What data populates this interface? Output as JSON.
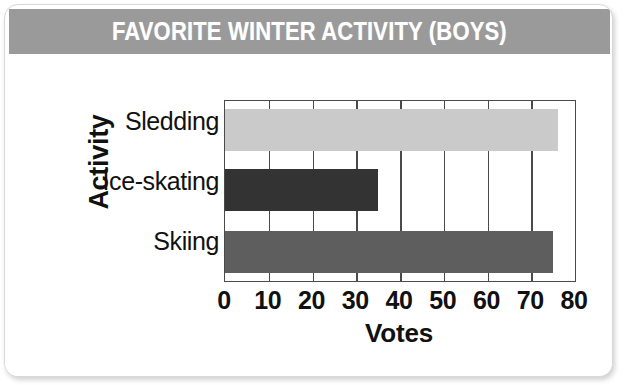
{
  "card": {
    "background_color": "#ffffff",
    "border_color": "#d8d8d8"
  },
  "banner": {
    "title": "FAVORITE WINTER ACTIVITY (BOYS)",
    "background_color": "#9a9a9a",
    "text_color": "#ffffff"
  },
  "chart_data": {
    "type": "bar",
    "orientation": "horizontal",
    "title": "FAVORITE WINTER ACTIVITY (BOYS)",
    "categories": [
      "Sledding",
      "Ice-skating",
      "Skiing"
    ],
    "values": [
      76,
      35,
      75
    ],
    "xlabel": "Votes",
    "ylabel": "Activity",
    "xlim": [
      0,
      80
    ],
    "xticks": [
      "0",
      "10",
      "20",
      "30",
      "40",
      "50",
      "60",
      "70",
      "80"
    ],
    "xtick_values": [
      0,
      10,
      20,
      30,
      40,
      50,
      60,
      70,
      80
    ],
    "grid": "vertical",
    "legend": "none",
    "bar_colors": [
      "#cacaca",
      "#333333",
      "#5e5e5e"
    ]
  }
}
